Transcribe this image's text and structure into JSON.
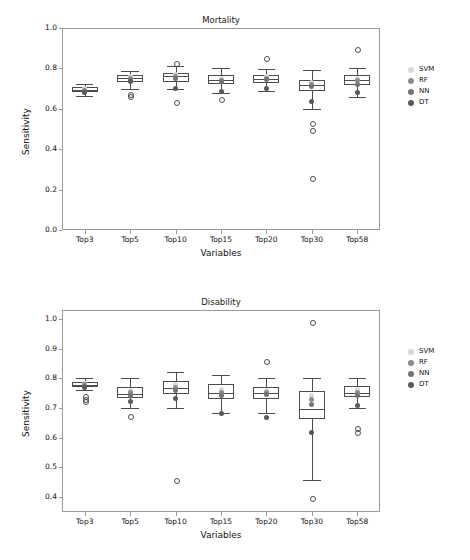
{
  "figure": {
    "width": 470,
    "height": 560,
    "background": "#ffffff"
  },
  "legend": {
    "entries": [
      {
        "label": "SVM",
        "color": "#d9d9d9"
      },
      {
        "label": "RF",
        "color": "#8c8c8c"
      },
      {
        "label": "NN",
        "color": "#737373"
      },
      {
        "label": "DT",
        "color": "#595959"
      }
    ]
  },
  "chart_data": [
    {
      "type": "box",
      "title": "Mortality",
      "xlabel": "Variables",
      "ylabel": "Sensitivity",
      "ylim": [
        0.0,
        1.0
      ],
      "yticks": [
        "0.0",
        "0.2",
        "0.4",
        "0.6",
        "0.8",
        "1.0"
      ],
      "ytickvals": [
        0.0,
        0.2,
        0.4,
        0.6,
        0.8,
        1.0
      ],
      "categories": [
        "Top3",
        "Top5",
        "Top10",
        "Top15",
        "Top20",
        "Top30",
        "Top58"
      ],
      "grid": false,
      "legend_position": "right",
      "boxes": [
        {
          "category": "Top3",
          "q1": 0.685,
          "median": 0.695,
          "q3": 0.706,
          "whisker_low": 0.663,
          "whisker_high": 0.722,
          "fliers": []
        },
        {
          "category": "Top5",
          "q1": 0.735,
          "median": 0.752,
          "q3": 0.765,
          "whisker_low": 0.7,
          "whisker_high": 0.787,
          "fliers": [
            0.672,
            0.665
          ]
        },
        {
          "category": "Top10",
          "q1": 0.735,
          "median": 0.76,
          "q3": 0.778,
          "whisker_low": 0.7,
          "whisker_high": 0.81,
          "fliers": [
            0.828,
            0.633
          ]
        },
        {
          "category": "Top15",
          "q1": 0.722,
          "median": 0.742,
          "q3": 0.768,
          "whisker_low": 0.678,
          "whisker_high": 0.8,
          "fliers": [
            0.65
          ]
        },
        {
          "category": "Top20",
          "q1": 0.728,
          "median": 0.75,
          "q3": 0.768,
          "whisker_low": 0.69,
          "whisker_high": 0.795,
          "fliers": [
            0.852
          ]
        },
        {
          "category": "Top30",
          "q1": 0.69,
          "median": 0.72,
          "q3": 0.742,
          "whisker_low": 0.6,
          "whisker_high": 0.79,
          "fliers": [
            0.53,
            0.495,
            0.255
          ]
        },
        {
          "category": "Top58",
          "q1": 0.718,
          "median": 0.742,
          "q3": 0.765,
          "whisker_low": 0.66,
          "whisker_high": 0.8,
          "fliers": [
            0.898
          ]
        }
      ],
      "points": {
        "SVM": [
          0.699,
          0.758,
          0.772,
          0.752,
          0.76,
          0.728,
          0.752
        ],
        "RF": [
          0.69,
          0.748,
          0.76,
          0.742,
          0.752,
          0.72,
          0.742
        ],
        "NN": [
          0.688,
          0.742,
          0.748,
          0.735,
          0.745,
          0.712,
          0.722
        ],
        "DT": [
          0.683,
          0.735,
          0.7,
          0.688,
          0.7,
          0.638,
          0.682
        ]
      }
    },
    {
      "type": "box",
      "title": "Disability",
      "xlabel": "Variables",
      "ylabel": "Sensitivity",
      "ylim": [
        0.35,
        1.03
      ],
      "yticks": [
        "0.4",
        "0.5",
        "0.6",
        "0.7",
        "0.8",
        "0.9",
        "1.0"
      ],
      "ytickvals": [
        0.4,
        0.5,
        0.6,
        0.7,
        0.8,
        0.9,
        1.0
      ],
      "categories": [
        "Top3",
        "Top5",
        "Top10",
        "Top15",
        "Top20",
        "Top30",
        "Top58"
      ],
      "grid": false,
      "legend_position": "right",
      "boxes": [
        {
          "category": "Top3",
          "q1": 0.772,
          "median": 0.778,
          "q3": 0.787,
          "whisker_low": 0.762,
          "whisker_high": 0.8,
          "fliers": [
            0.742,
            0.732,
            0.722
          ]
        },
        {
          "category": "Top5",
          "q1": 0.735,
          "median": 0.748,
          "q3": 0.772,
          "whisker_low": 0.7,
          "whisker_high": 0.8,
          "fliers": [
            0.672
          ]
        },
        {
          "category": "Top10",
          "q1": 0.748,
          "median": 0.768,
          "q3": 0.79,
          "whisker_low": 0.7,
          "whisker_high": 0.822,
          "fliers": [
            0.458
          ]
        },
        {
          "category": "Top15",
          "q1": 0.73,
          "median": 0.752,
          "q3": 0.782,
          "whisker_low": 0.682,
          "whisker_high": 0.812,
          "fliers": []
        },
        {
          "category": "Top20",
          "q1": 0.73,
          "median": 0.752,
          "q3": 0.772,
          "whisker_low": 0.682,
          "whisker_high": 0.8,
          "fliers": [
            0.858
          ]
        },
        {
          "category": "Top30",
          "q1": 0.662,
          "median": 0.698,
          "q3": 0.758,
          "whisker_low": 0.458,
          "whisker_high": 0.8,
          "fliers": [
            0.99,
            0.398
          ]
        },
        {
          "category": "Top58",
          "q1": 0.738,
          "median": 0.752,
          "q3": 0.775,
          "whisker_low": 0.7,
          "whisker_high": 0.8,
          "fliers": [
            0.632,
            0.618
          ]
        }
      ],
      "points": {
        "SVM": [
          0.782,
          0.76,
          0.778,
          0.762,
          0.76,
          0.742,
          0.762
        ],
        "RF": [
          0.778,
          0.752,
          0.77,
          0.752,
          0.752,
          0.73,
          0.752
        ],
        "NN": [
          0.772,
          0.742,
          0.758,
          0.742,
          0.745,
          0.712,
          0.742
        ],
        "DT": [
          0.768,
          0.722,
          0.732,
          0.682,
          0.668,
          0.618,
          0.71
        ]
      }
    }
  ]
}
